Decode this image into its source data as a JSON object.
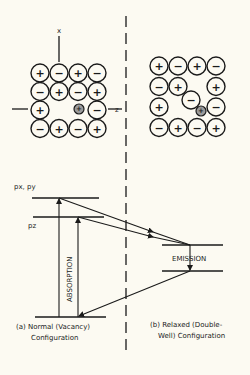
{
  "axes": {
    "x_label": "x",
    "z_label": "z"
  },
  "lattice_a": {
    "rows": [
      [
        "+",
        "-",
        "+",
        "-"
      ],
      [
        "-",
        "+",
        "-",
        "+"
      ],
      [
        "+",
        "",
        "",
        "-"
      ],
      [
        "-",
        "+",
        "-",
        "+"
      ]
    ],
    "defect_symbol": "+"
  },
  "lattice_b": {
    "rows": [
      [
        "+",
        "-",
        "+",
        "-"
      ],
      [
        "-",
        "+",
        "",
        "+"
      ],
      [
        "+",
        "",
        "",
        "-"
      ],
      [
        "-",
        "+",
        "-",
        "+"
      ]
    ],
    "displaced_ion": "-",
    "defect_symbol": "+"
  },
  "levels": {
    "upper_label": "px, py",
    "lower_label": "pz"
  },
  "transitions": {
    "absorption": "ABSORPTION",
    "emission": "EMISSION"
  },
  "captions": {
    "a_line1": "(a) Normal (Vacancy)",
    "a_line2": "Configuration",
    "b_line1": "(b) Relaxed (Double-",
    "b_line2": "Well) Configuration"
  }
}
